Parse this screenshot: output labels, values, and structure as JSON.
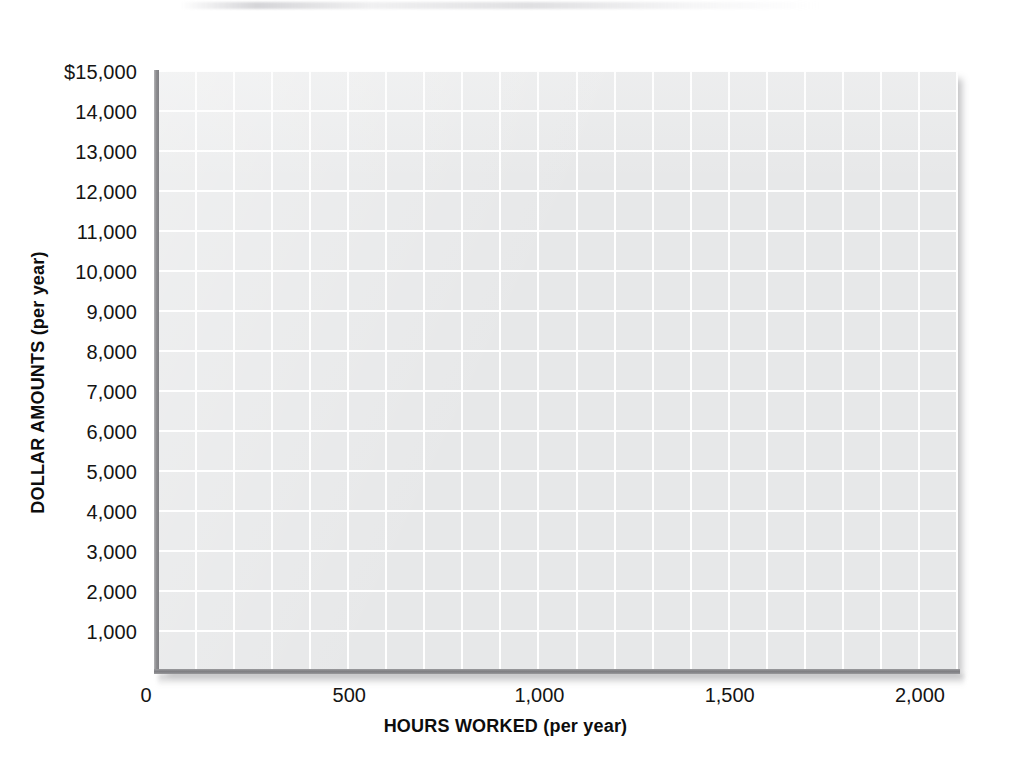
{
  "chart_data": {
    "type": "table",
    "title": "",
    "subtitle": "",
    "xlabel": "HOURS WORKED (per year)",
    "ylabel": "DOLLAR AMOUNTS (per year)",
    "grid": true,
    "legend": null,
    "series": [],
    "values": [],
    "categories": [],
    "xlim": [
      0,
      2100
    ],
    "ylim": [
      0,
      15000
    ],
    "x_tick_labels": [
      "0",
      "500",
      "1,000",
      "1,500",
      "2,000"
    ],
    "x_tick_values": [
      0,
      500,
      1000,
      1500,
      2000
    ],
    "y_tick_labels": [
      "$15,000",
      "14,000",
      "13,000",
      "12,000",
      "11,000",
      "10,000",
      "9,000",
      "8,000",
      "7,000",
      "6,000",
      "5,000",
      "4,000",
      "3,000",
      "2,000",
      "1,000"
    ],
    "y_tick_values": [
      15000,
      14000,
      13000,
      12000,
      11000,
      10000,
      9000,
      8000,
      7000,
      6000,
      5000,
      4000,
      3000,
      2000,
      1000
    ],
    "grid_columns": 21,
    "grid_rows": 15,
    "colors": {
      "plot_fill": "#e7e8e9",
      "gridline": "#ffffff",
      "axis_line": "#8d8d90",
      "text": "#141414",
      "page_background": "#ffffff"
    }
  },
  "axis_titles": {
    "x": "HOURS WORKED (per year)",
    "y": "DOLLAR AMOUNTS (per year)"
  }
}
